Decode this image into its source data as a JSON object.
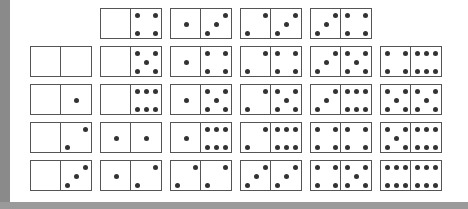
{
  "colors": {
    "frame": "#8a8a8a",
    "border": "#555555",
    "pip": "#333333"
  },
  "rows": [
    {
      "y": 8,
      "x0": 100,
      "dominoes": [
        [
          0,
          4
        ],
        [
          1,
          3
        ],
        [
          2,
          3
        ],
        [
          3,
          4
        ]
      ]
    },
    {
      "y": 46,
      "x0": 30,
      "dominoes": [
        [
          0,
          0
        ],
        [
          0,
          5
        ],
        [
          1,
          4
        ],
        [
          2,
          4
        ],
        [
          3,
          5
        ],
        [
          4,
          6
        ]
      ]
    },
    {
      "y": 84,
      "x0": 30,
      "dominoes": [
        [
          0,
          1
        ],
        [
          0,
          6
        ],
        [
          1,
          5
        ],
        [
          2,
          5
        ],
        [
          3,
          6
        ],
        [
          5,
          5
        ]
      ]
    },
    {
      "y": 122,
      "x0": 30,
      "dominoes": [
        [
          0,
          2
        ],
        [
          1,
          1
        ],
        [
          1,
          6
        ],
        [
          2,
          6
        ],
        [
          4,
          4
        ],
        [
          5,
          6
        ]
      ]
    },
    {
      "y": 160,
      "x0": 30,
      "dominoes": [
        [
          0,
          3
        ],
        [
          1,
          2
        ],
        [
          2,
          2
        ],
        [
          3,
          3
        ],
        [
          4,
          5
        ],
        [
          6,
          6
        ]
      ]
    }
  ],
  "spacing": 70
}
